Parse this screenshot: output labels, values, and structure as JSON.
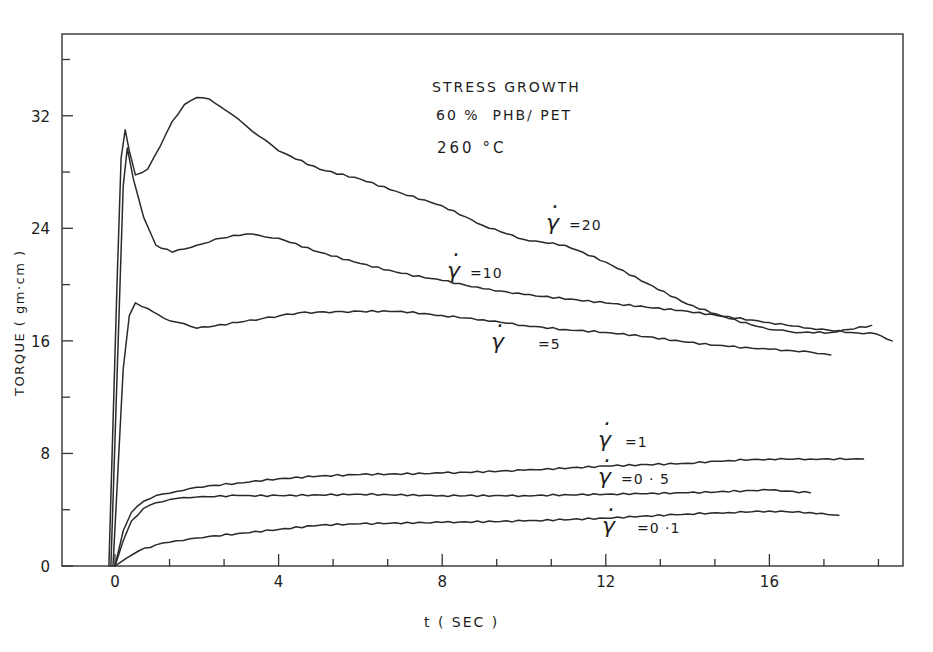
{
  "chart_data": {
    "type": "line",
    "title": "STRESS GROWTH",
    "subtitle": "60 % PHB/ PET",
    "annotation": "260 °C",
    "xlabel": "t ( SEC )",
    "ylabel": "TORQUE ( gm·cm )",
    "xlim": [
      -1.3,
      19.3
    ],
    "ylim": [
      0,
      36.5
    ],
    "xticks": [
      0,
      4,
      8,
      12,
      16
    ],
    "yticks": [
      0,
      8,
      16,
      24,
      32
    ],
    "grid": false,
    "legend_position": "inline labels next to curves",
    "series": [
      {
        "name": "γ̇ = 20",
        "label_value": "=20",
        "x": [
          -0.15,
          0.05,
          0.15,
          0.25,
          0.35,
          0.5,
          0.8,
          1.1,
          1.4,
          1.7,
          2.0,
          2.3,
          2.7,
          3.2,
          4.0,
          5.0,
          6.0,
          7.0,
          8.0,
          9.0,
          10.0,
          11.0,
          12.0,
          13.0,
          14.0,
          15.0,
          16.0,
          16.8,
          17.5,
          18.5
        ],
        "values": [
          0,
          20.0,
          29.0,
          31.0,
          29.5,
          27.8,
          28.2,
          29.8,
          31.6,
          32.8,
          33.3,
          33.2,
          32.4,
          31.3,
          29.5,
          28.2,
          27.5,
          26.5,
          25.6,
          24.2,
          23.2,
          22.8,
          21.6,
          20.1,
          18.6,
          17.6,
          16.8,
          16.6,
          16.6,
          17.1
        ]
      },
      {
        "name": "γ̇ = 10",
        "label_value": "=10",
        "x": [
          -0.1,
          0.1,
          0.2,
          0.3,
          0.45,
          0.7,
          1.0,
          1.4,
          2.0,
          2.6,
          3.2,
          4.0,
          5.0,
          6.0,
          7.0,
          8.0,
          9.0,
          10.0,
          12.0,
          14.0,
          16.0,
          17.0,
          18.0,
          18.6,
          19.0
        ],
        "values": [
          0,
          18.0,
          27.0,
          29.7,
          27.5,
          24.8,
          22.8,
          22.3,
          22.8,
          23.3,
          23.6,
          23.3,
          22.3,
          21.5,
          20.8,
          20.3,
          19.7,
          19.3,
          18.7,
          18.1,
          17.3,
          16.9,
          16.6,
          16.5,
          16.0
        ]
      },
      {
        "name": "γ̇ = 5",
        "label_value": "=5",
        "x": [
          -0.05,
          0.2,
          0.35,
          0.5,
          0.8,
          1.2,
          2.0,
          3.0,
          4.5,
          6.0,
          7.0,
          8.0,
          9.0,
          10.0,
          11.0,
          12.0,
          13.0,
          14.0,
          15.0,
          16.0,
          17.0,
          17.5
        ],
        "values": [
          0,
          14.0,
          17.8,
          18.7,
          18.3,
          17.6,
          16.9,
          17.3,
          18.0,
          18.1,
          18.1,
          17.8,
          17.5,
          17.1,
          16.8,
          16.6,
          16.3,
          15.9,
          15.6,
          15.4,
          15.2,
          15.0
        ]
      },
      {
        "name": "γ̇ = 1",
        "label_value": "=1",
        "x": [
          0.0,
          0.2,
          0.4,
          0.7,
          1.0,
          1.5,
          2.0,
          3.0,
          4.0,
          5.0,
          6.0,
          8.0,
          10.0,
          12.0,
          14.0,
          15.0,
          16.0,
          17.0,
          18.3
        ],
        "values": [
          0,
          2.5,
          3.8,
          4.6,
          5.0,
          5.3,
          5.6,
          5.9,
          6.2,
          6.4,
          6.5,
          6.6,
          6.8,
          7.1,
          7.3,
          7.5,
          7.6,
          7.6,
          7.6
        ]
      },
      {
        "name": "γ̇ = 0.5",
        "label_value": "=0 · 5",
        "x": [
          0.0,
          0.2,
          0.4,
          0.7,
          1.0,
          1.5,
          2.0,
          3.0,
          4.0,
          6.0,
          8.0,
          10.0,
          12.0,
          14.0,
          16.0,
          17.0
        ],
        "values": [
          0,
          1.8,
          3.2,
          4.1,
          4.5,
          4.8,
          4.9,
          5.0,
          5.0,
          5.1,
          5.0,
          5.0,
          5.1,
          5.2,
          5.4,
          5.2
        ]
      },
      {
        "name": "γ̇ = 0.1",
        "label_value": "=0 ·1",
        "x": [
          0.0,
          0.3,
          0.6,
          1.0,
          1.5,
          2.0,
          3.0,
          4.0,
          5.0,
          6.0,
          8.0,
          10.0,
          12.0,
          14.0,
          15.0,
          16.0,
          17.0,
          17.7
        ],
        "values": [
          0,
          0.6,
          1.1,
          1.5,
          1.8,
          2.0,
          2.3,
          2.6,
          2.9,
          3.0,
          3.1,
          3.2,
          3.4,
          3.7,
          3.8,
          3.9,
          3.8,
          3.6
        ]
      }
    ]
  },
  "labels": {
    "title": "STRESS GROWTH",
    "subtitle": "60 %  PHB/ PET",
    "temperature": "260 °C",
    "xlabel": "t ( SEC )",
    "ylabel": "TORQUE ( gm·cm )",
    "gamma_symbol": "γ",
    "series_labels": [
      "=20",
      "=10",
      "=5",
      "=1",
      "=0 · 5",
      "=0 ·1"
    ]
  },
  "style": {
    "line_color": "#2a2a2a",
    "axis_color": "#333333",
    "background": "#ffffff"
  }
}
